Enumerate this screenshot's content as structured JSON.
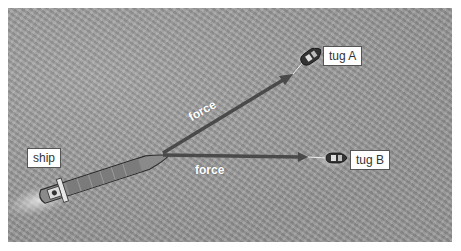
{
  "diagram": {
    "background": "aerial view of sea surface with waves",
    "ship": {
      "label": "ship"
    },
    "tugs": [
      {
        "id": "A",
        "label": "tug A"
      },
      {
        "id": "B",
        "label": "tug B"
      }
    ],
    "forces": [
      {
        "label": "force",
        "from": "ship",
        "to": "tug A"
      },
      {
        "label": "force",
        "from": "ship",
        "to": "tug B"
      }
    ],
    "colors": {
      "arrow": "#4a4a4a",
      "sea": "#9c9c9c",
      "label_bg": "#ffffff"
    }
  }
}
